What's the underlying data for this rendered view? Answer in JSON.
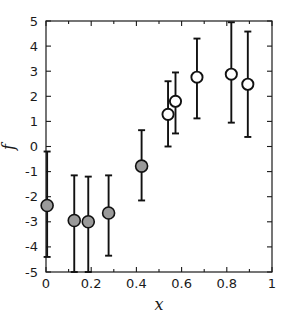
{
  "chart_data": {
    "type": "scatter",
    "title": "",
    "subtitle": "",
    "xlabel": "x",
    "ylabel": "f",
    "xlim": [
      0,
      1
    ],
    "ylim": [
      -5,
      5
    ],
    "grid": false,
    "legend": null,
    "xticks": [
      0,
      0.2,
      0.4,
      0.6,
      0.8,
      1
    ],
    "xticklabels": [
      "0",
      "0.2",
      "0.4",
      "0.6",
      "0.8",
      "1"
    ],
    "yticks": [
      -5,
      -4,
      -3,
      -2,
      -1,
      0,
      1,
      2,
      3,
      4,
      5
    ],
    "yticklabels": [
      "-5",
      "-4",
      "-3",
      "-2",
      "-1",
      "0",
      "1",
      "2",
      "3",
      "4",
      "5"
    ],
    "xminorticks": [
      0.1,
      0.3,
      0.5,
      0.7,
      0.9
    ],
    "marker_styles": {
      "filled": {
        "name": "gray-filled-circle",
        "fill": "#9a9a9a",
        "edge": "#111111"
      },
      "open": {
        "name": "open-circle",
        "fill": "#ffffff",
        "edge": "#111111"
      }
    },
    "points": [
      {
        "x": 0.005,
        "y": -2.35,
        "ylo": -4.4,
        "yhi": -0.2,
        "style": "filled"
      },
      {
        "x": 0.125,
        "y": -2.95,
        "ylo": -5.0,
        "yhi": -1.15,
        "style": "filled"
      },
      {
        "x": 0.187,
        "y": -3.0,
        "ylo": -5.0,
        "yhi": -1.2,
        "style": "filled"
      },
      {
        "x": 0.277,
        "y": -2.65,
        "ylo": -4.35,
        "yhi": -1.15,
        "style": "filled"
      },
      {
        "x": 0.423,
        "y": -0.78,
        "ylo": -2.15,
        "yhi": 0.65,
        "style": "filled"
      },
      {
        "x": 0.54,
        "y": 1.28,
        "ylo": 0.0,
        "yhi": 2.6,
        "style": "open"
      },
      {
        "x": 0.573,
        "y": 1.8,
        "ylo": 0.52,
        "yhi": 2.95,
        "style": "open"
      },
      {
        "x": 0.668,
        "y": 2.76,
        "ylo": 1.12,
        "yhi": 4.3,
        "style": "open"
      },
      {
        "x": 0.82,
        "y": 2.88,
        "ylo": 0.95,
        "yhi": 4.95,
        "style": "open"
      },
      {
        "x": 0.893,
        "y": 2.48,
        "ylo": 0.38,
        "yhi": 4.58,
        "style": "open"
      }
    ]
  }
}
